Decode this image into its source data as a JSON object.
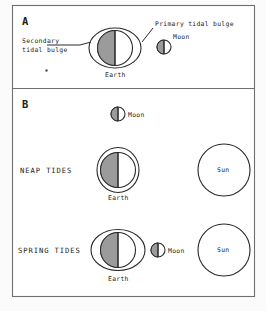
{
  "figure": {
    "title_panels": [
      {
        "id": "A",
        "label": "A"
      },
      {
        "id": "B",
        "label": "B"
      }
    ],
    "panel_a": {
      "panel_label": "A",
      "labels": {
        "secondary_line1": "Secondary",
        "secondary_line2": "tidal  bulge",
        "primary": "Primary  tidal  bulge",
        "earth": "Earth",
        "moon": "Moon"
      }
    },
    "panel_b": {
      "panel_label": "B",
      "top_moon_label": "Moon",
      "rows": [
        {
          "row_label": "NEAP  TIDES",
          "earth_label": "Earth",
          "sun_label": "Sun",
          "envelope": "circular",
          "moon_label": null
        },
        {
          "row_label": "SPRING  TIDES",
          "earth_label": "Earth",
          "sun_label": "Sun",
          "envelope": "elongated",
          "moon_label": "Moon"
        }
      ]
    },
    "colors": {
      "frame_stroke": "#6f6f73",
      "ink": "#2a2a2a",
      "shade_fill": "#9b9b9b",
      "body_fill": "#ffffff",
      "page_background": "#fbfbfb"
    }
  }
}
